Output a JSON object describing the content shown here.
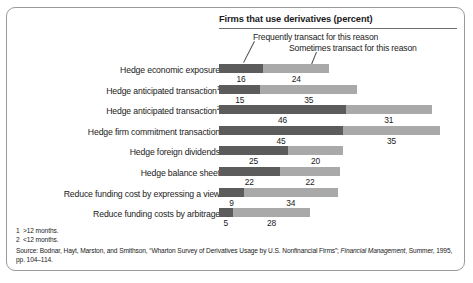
{
  "chart_data": {
    "type": "bar",
    "title": "Firms that use derivatives (percent)",
    "xlabel": "",
    "ylabel": "",
    "orientation": "horizontal",
    "stacked": true,
    "grid": false,
    "legend_position": "top-inside",
    "xlim": [
      0,
      80
    ],
    "categories": [
      "Hedge economic exposure",
      "Hedge anticipated transaction1",
      "Hedge anticipated transaction2",
      "Hedge firm commitment transaction",
      "Hedge foreign dividends",
      "Hedge balance sheet",
      "Reduce funding cost by expressing a view",
      "Reduce funding costs by arbitrage"
    ],
    "series": [
      {
        "name": "Frequently transact for this reason",
        "color": "#5c5c5c",
        "values": [
          16,
          15,
          46,
          45,
          25,
          22,
          9,
          5
        ]
      },
      {
        "name": "Sometimes transact for this reason",
        "color": "#a9a9a9",
        "values": [
          24,
          35,
          31,
          35,
          20,
          22,
          34,
          28
        ]
      }
    ]
  },
  "rows": [
    {
      "label": "Hedge economic exposure",
      "sup": "",
      "dark": 16,
      "light": 24
    },
    {
      "label": "Hedge anticipated transaction",
      "sup": "1",
      "dark": 15,
      "light": 35
    },
    {
      "label": "Hedge anticipated transaction",
      "sup": "2",
      "dark": 46,
      "light": 31
    },
    {
      "label": "Hedge firm commitment transaction",
      "sup": "",
      "dark": 45,
      "light": 35
    },
    {
      "label": "Hedge foreign dividends",
      "sup": "",
      "dark": 25,
      "light": 20
    },
    {
      "label": "Hedge balance sheet",
      "sup": "",
      "dark": 22,
      "light": 22
    },
    {
      "label": "Reduce funding cost by expressing a view",
      "sup": "",
      "dark": 9,
      "light": 34
    },
    {
      "label": "Reduce funding costs by arbitrage",
      "sup": "",
      "dark": 5,
      "light": 28
    }
  ],
  "legend": {
    "frequently": "Frequently transact for this reason",
    "sometimes": "Sometimes transact for this reason"
  },
  "footnotes": [
    {
      "mark": "1",
      "text": ">12 months."
    },
    {
      "mark": "2",
      "text": "<12 months."
    }
  ],
  "source": {
    "lead": "Source: Bodnar, Hayt, Marston, and Smithson, “Wharton Survey of Derivatives Usage by U.S. Nonfinancial Firms”; ",
    "italic": "Financial Management",
    "tail": ", Summer, 1995, pp. 104–114."
  }
}
